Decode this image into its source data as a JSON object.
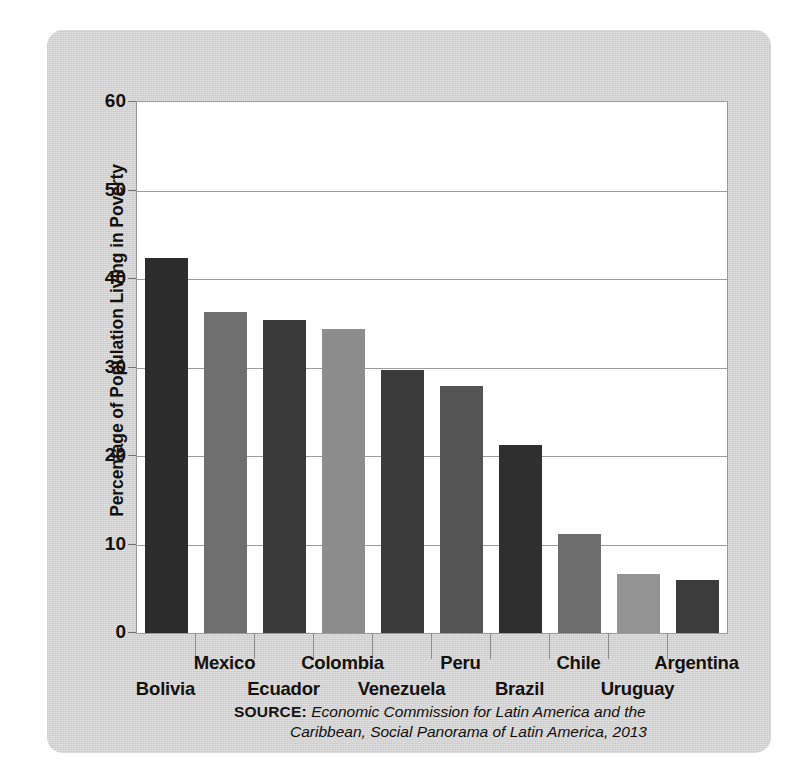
{
  "chart_data": {
    "type": "bar",
    "title": "",
    "xlabel": "",
    "ylabel": "Percentage of Population Living in Poverty",
    "ylim": [
      0,
      60
    ],
    "yticks": [
      0,
      10,
      20,
      30,
      40,
      50,
      60
    ],
    "grid": true,
    "legend": "none",
    "categories": [
      "Bolivia",
      "Mexico",
      "Ecuador",
      "Colombia",
      "Venezuela",
      "Peru",
      "Brazil",
      "Chile",
      "Uruguay",
      "Argentina"
    ],
    "values": [
      42.4,
      36.3,
      35.4,
      34.3,
      29.7,
      27.9,
      21.2,
      11.2,
      6.7,
      6.0
    ],
    "bar_colors": [
      "#2c2c2c",
      "#6f6f6f",
      "#3a3a3a",
      "#8d8d8d",
      "#3b3b3b",
      "#545454",
      "#2f2f2f",
      "#6e6e6e",
      "#939393",
      "#3c3c3c"
    ],
    "label_rows": [
      "bottom",
      "top",
      "bottom",
      "top",
      "bottom",
      "top",
      "bottom",
      "top",
      "bottom",
      "top"
    ]
  },
  "axis": {
    "y_title": "Percentage of Population Living in Poverty",
    "tick_labels": [
      "60",
      "50",
      "40",
      "30",
      "20",
      "10",
      "0"
    ]
  },
  "source": {
    "label": "SOURCE:",
    "line1": "Economic Commission for Latin America and the",
    "line2": "Caribbean, Social Panorama of Latin America, 2013"
  },
  "colors": {
    "card_background": "#d2d2d2",
    "plot_background": "#ffffff",
    "gridline": "#9d9d9d",
    "frame": "#9a9a9a",
    "text": "#14110f"
  }
}
